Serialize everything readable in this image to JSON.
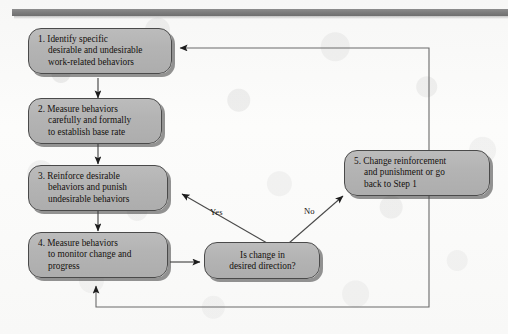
{
  "figure": {
    "type": "flowchart",
    "orientation": "top-down with feedback loops"
  },
  "rule": {
    "name": "header-rule",
    "color": "#7e7e7e"
  },
  "palette": {
    "node_fill": "#b4b4b4",
    "node_border": "#4a4a4a",
    "node_shadow": "#3c3c3c",
    "line": "#5a5a5a",
    "text": "#14100e",
    "background": "#fbfbfa"
  },
  "nodes": [
    {
      "id": "step1",
      "name": "step-1-identify",
      "lines": [
        "1. Identify specific",
        "desirable and undesirable",
        "work-related behaviors"
      ]
    },
    {
      "id": "step2",
      "name": "step-2-measure-baseline",
      "lines": [
        "2. Measure behaviors",
        "carefully and formally",
        "to establish base rate"
      ]
    },
    {
      "id": "step3",
      "name": "step-3-reinforce",
      "lines": [
        "3. Reinforce desirable",
        "behaviors and punish",
        "undesirable behaviors"
      ]
    },
    {
      "id": "step4",
      "name": "step-4-monitor",
      "lines": [
        "4. Measure behaviors",
        "to monitor change and",
        "progress"
      ]
    },
    {
      "id": "step5",
      "name": "step-5-change-reinforcement",
      "lines": [
        "5. Change reinforcement",
        "and punishment or go",
        "back to Step 1"
      ]
    },
    {
      "id": "decision",
      "name": "decision-is-change-desired",
      "lines": [
        "Is change in",
        "desired direction?"
      ]
    }
  ],
  "edge_labels": [
    {
      "name": "edge-label-yes",
      "text": "Yes"
    },
    {
      "name": "edge-label-no",
      "text": "No"
    }
  ],
  "edges": [
    {
      "from": "step1",
      "to": "step2",
      "label": ""
    },
    {
      "from": "step2",
      "to": "step3",
      "label": ""
    },
    {
      "from": "step3",
      "to": "step4",
      "label": ""
    },
    {
      "from": "step4",
      "to": "decision",
      "label": ""
    },
    {
      "from": "decision",
      "to": "step3",
      "label": "Yes"
    },
    {
      "from": "decision",
      "to": "step5",
      "label": "No"
    },
    {
      "from": "step5",
      "to": "step1",
      "label": ""
    },
    {
      "from": "step5",
      "to": "step4",
      "label": ""
    }
  ]
}
